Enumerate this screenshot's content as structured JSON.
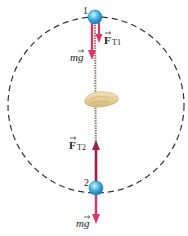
{
  "diagram": {
    "type": "vertical-circle-free-body",
    "positions": [
      {
        "label": "1",
        "location": "top"
      },
      {
        "label": "2",
        "location": "bottom"
      }
    ],
    "forces": {
      "tension_top": {
        "symbol": "F",
        "subscript": "T1"
      },
      "tension_bottom": {
        "symbol": "F",
        "subscript": "T2"
      },
      "weight_top": {
        "text": "mg"
      },
      "weight_bottom": {
        "text": "mg"
      }
    },
    "colors": {
      "arrow": "#e0336a",
      "arrow_dark": "#a0204d",
      "ball": "#48b4e6",
      "ball_highlight": "#c9ecfb",
      "rope": "#8a7f72",
      "circle": "#333333",
      "hand": "#e9d3a6"
    }
  }
}
